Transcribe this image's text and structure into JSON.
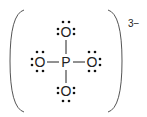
{
  "diagram": {
    "central_atom": "P",
    "ligands": [
      {
        "position": "top",
        "symbol": "O",
        "lone_pairs": 3
      },
      {
        "position": "left",
        "symbol": "O",
        "lone_pairs": 3
      },
      {
        "position": "right",
        "symbol": "O",
        "lone_pairs": 3
      },
      {
        "position": "bottom",
        "symbol": "O",
        "lone_pairs": 3
      }
    ],
    "bonds": [
      "single",
      "single",
      "single",
      "single"
    ],
    "charge": "3−",
    "colors": {
      "ink": "#222222",
      "background": "#ffffff"
    }
  }
}
